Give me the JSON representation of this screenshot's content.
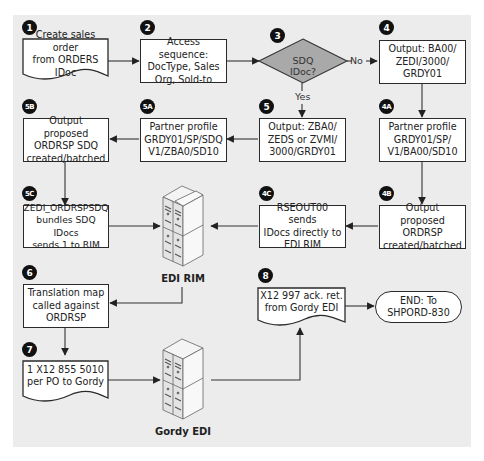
{
  "diagram": {
    "type": "flowchart",
    "nodes": {
      "n1": {
        "badge": "1",
        "text": "Create sales order\nfrom ORDERS IDoc",
        "shape": "document"
      },
      "n2": {
        "badge": "2",
        "text": "Access sequence:\nDocType, Sales\nOrg, Sold-to",
        "shape": "process"
      },
      "n3": {
        "badge": "3",
        "text": "SDQ IDoc?",
        "shape": "decision"
      },
      "n4": {
        "badge": "4",
        "text": "Output: BA00/\nZEDI/3000/\nGRDY01",
        "shape": "process"
      },
      "n4A": {
        "badge": "4A",
        "text": "Partner profile\nGRDY01/SP/\nV1/BA00/SD10",
        "shape": "process"
      },
      "n4B": {
        "badge": "4B",
        "text": "Output proposed\nORDRSP\ncreated/batched",
        "shape": "process"
      },
      "n4C": {
        "badge": "4C",
        "text": "RSEOUT00 sends\nIDocs directly to\nEDI RIM",
        "shape": "process"
      },
      "n5": {
        "badge": "5",
        "text": "Output: ZBA0/\nZEDS or ZVMI/\n3000/GRDY01",
        "shape": "process"
      },
      "n5A": {
        "badge": "5A",
        "text": "Partner profile\nGRDY01/SP/SDQ\nV1/ZBA0/SD10",
        "shape": "process"
      },
      "n5B": {
        "badge": "5B",
        "text": "Output proposed\nORDRSP SDQ\ncreated/batched",
        "shape": "process"
      },
      "n5C": {
        "badge": "5C",
        "text": "ZEDI_ORDRSPSDQ\nbundles SDQ IDocs\nsends 1 to RIM",
        "shape": "process"
      },
      "n6": {
        "badge": "6",
        "text": "Translation map\ncalled against\nORDRSP",
        "shape": "process"
      },
      "n7": {
        "badge": "7",
        "text": "1 X12 855 5010\nper PO to Gordy",
        "shape": "document"
      },
      "n8": {
        "badge": "8",
        "text": "X12 997 ack. ret.\nfrom Gordy EDI",
        "shape": "document"
      },
      "end": {
        "text": "END: To\nSHPORD-830",
        "shape": "terminal"
      },
      "rim": {
        "label": "EDI RIM",
        "shape": "server"
      },
      "gordy": {
        "label": "Gordy EDI",
        "shape": "server"
      }
    },
    "edge_labels": {
      "no": "No",
      "yes": "Yes"
    },
    "edges": [
      [
        "n1",
        "n2"
      ],
      [
        "n2",
        "n3"
      ],
      [
        "n3",
        "n4",
        "No"
      ],
      [
        "n3",
        "n5",
        "Yes"
      ],
      [
        "n4",
        "n4A"
      ],
      [
        "n4A",
        "n4B"
      ],
      [
        "n4B",
        "n4C"
      ],
      [
        "n4C",
        "rim"
      ],
      [
        "n5",
        "n5A"
      ],
      [
        "n5A",
        "n5B"
      ],
      [
        "n5B",
        "n5C"
      ],
      [
        "n5C",
        "rim"
      ],
      [
        "rim",
        "n6"
      ],
      [
        "n6",
        "n7"
      ],
      [
        "n7",
        "gordy"
      ],
      [
        "gordy",
        "n8"
      ],
      [
        "n8",
        "end"
      ]
    ],
    "colors": {
      "panel": "#ececec",
      "box_fill": "#ffffff",
      "decision_fill": "#a9a9a9",
      "stroke": "#2a2a2a",
      "badge": "#111111"
    }
  },
  "caption": {
    "text": "Figure — (caption cut off)"
  }
}
